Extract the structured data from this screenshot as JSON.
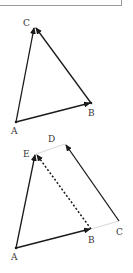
{
  "diagram": {
    "type": "vector-triangle",
    "figure1": {
      "points": {
        "A": {
          "label": "A",
          "x": 16,
          "y": 122
        },
        "B": {
          "label": "B",
          "x": 91,
          "y": 103
        },
        "C": {
          "label": "C",
          "x": 35,
          "y": 27
        }
      },
      "vectors": [
        {
          "from": "A",
          "to": "B",
          "style": "solid"
        },
        {
          "from": "B",
          "to": "C",
          "style": "solid"
        },
        {
          "from": "A",
          "to": "C",
          "style": "solid"
        }
      ]
    },
    "figure2": {
      "points": {
        "A": {
          "label": "A",
          "x": 16,
          "y": 248
        },
        "B": {
          "label": "B",
          "x": 91,
          "y": 229
        },
        "C": {
          "label": "C",
          "x": 119,
          "y": 221
        },
        "D": {
          "label": "D",
          "x": 65,
          "y": 144
        },
        "E": {
          "label": "E",
          "x": 36,
          "y": 154
        }
      },
      "vectors": [
        {
          "from": "A",
          "to": "B",
          "style": "solid"
        },
        {
          "from": "A",
          "to": "E",
          "style": "solid"
        },
        {
          "from": "C",
          "to": "D",
          "style": "solid"
        },
        {
          "from": "B",
          "to": "E",
          "style": "dashed"
        }
      ],
      "guides": [
        {
          "from": "B",
          "to": "C",
          "style": "light"
        },
        {
          "from": "E",
          "to": "D",
          "style": "light"
        }
      ]
    }
  }
}
